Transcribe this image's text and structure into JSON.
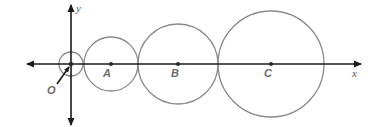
{
  "diagram": {
    "type": "tangent circles on coordinate axes",
    "axes": {
      "x_label": "x",
      "y_label": "y",
      "origin_label": "O"
    },
    "circles": [
      {
        "name": "origin-circle",
        "center_label": "",
        "cx": 71,
        "cy": 64,
        "r": 12
      },
      {
        "name": "circle-A",
        "center_label": "A",
        "cx": 111,
        "cy": 64,
        "r": 27
      },
      {
        "name": "circle-B",
        "center_label": "B",
        "cx": 178,
        "cy": 64,
        "r": 40
      },
      {
        "name": "circle-C",
        "center_label": "C",
        "cx": 271,
        "cy": 64,
        "r": 53
      }
    ],
    "colors": {
      "axis": "#1a1a1a",
      "circle": "#8a8a8a",
      "label": "#6b6b6b"
    }
  }
}
